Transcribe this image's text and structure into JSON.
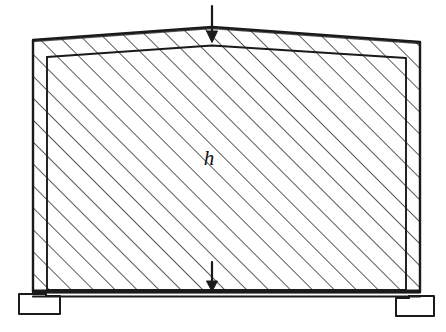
{
  "figure": {
    "type": "engineering-line-drawing",
    "background_color": "#ffffff",
    "ink_color": "#1a1a1a",
    "hatch_color": "#262626",
    "canvas": {
      "width": 446,
      "height": 332
    }
  },
  "labels": {
    "height_label": "h"
  },
  "geometry": {
    "outer_body": {
      "description": "Trapezoidal gable body with apex at top centre",
      "points": "33,40 212,27 420,42 420,292 33,292",
      "apex_x": 212,
      "apex_y": 27,
      "left_top_y": 40,
      "right_top_y": 42,
      "left_x": 33,
      "right_x": 420,
      "base_y": 292
    },
    "inner_outline": {
      "description": "Inner wall line offset inside the outer body",
      "points": "47,57 212,45 406,58 406,290 47,290",
      "left_x": 47,
      "right_x": 406,
      "top_left_y": 57,
      "top_right_y": 58,
      "base_y": 290
    },
    "base_band": {
      "top_y": 290,
      "bottom_y": 297,
      "left_x": 33,
      "right_x": 420
    },
    "footing_left": {
      "x": 18,
      "y": 292,
      "width": 42,
      "height": 22
    },
    "footing_right": {
      "x": 398,
      "y": 294,
      "width": 42,
      "height": 22
    },
    "hatching": {
      "angle_degrees": 45,
      "direction": "lower-left to upper-right",
      "spacing_px": 15.5,
      "stroke_width": 1.45
    }
  },
  "annotations": {
    "top_arrow": {
      "name": "top-load-arrow",
      "x": 212,
      "tail_y": 6,
      "head_y": 42,
      "direction": "down"
    },
    "bottom_arrow": {
      "name": "bottom-load-arrow",
      "x": 212,
      "tail_y": 262,
      "head_y": 291,
      "direction": "down"
    },
    "height_dimension": {
      "name": "height-label-h",
      "x": 209,
      "y": 160
    }
  }
}
